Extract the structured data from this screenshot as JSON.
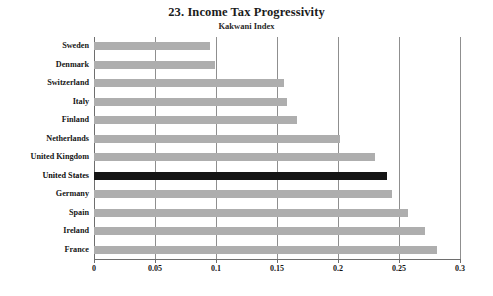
{
  "chart_data": {
    "type": "bar",
    "orientation": "horizontal",
    "title": "23. Income Tax Progressivity",
    "subtitle": "Kakwani Index",
    "xlabel": "",
    "ylabel": "",
    "xlim": [
      0,
      0.3
    ],
    "grid": true,
    "legend": "none",
    "xticks": [
      "0",
      "0.05",
      "0.1",
      "0.15",
      "0.2",
      "0.25",
      "0.3"
    ],
    "xtick_values": [
      0,
      0.05,
      0.1,
      0.15,
      0.2,
      0.25,
      0.3
    ],
    "categories": [
      "Sweden",
      "Denmark",
      "Switzerland",
      "Italy",
      "Finland",
      "Netherlands",
      "United Kingdom",
      "United States",
      "Germany",
      "Spain",
      "Ireland",
      "France"
    ],
    "values": [
      0.095,
      0.099,
      0.156,
      0.158,
      0.166,
      0.202,
      0.23,
      0.24,
      0.244,
      0.257,
      0.271,
      0.281
    ],
    "highlight_category": "United States",
    "colors": {
      "bar": "#aeaeae",
      "bar_highlight": "#151515",
      "grid": "#8f8f8f",
      "axis": "#6e6e6e",
      "text": "#161616",
      "background": "#ffffff"
    }
  }
}
